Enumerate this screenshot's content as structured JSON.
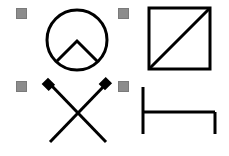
{
  "symbols": [
    {
      "name": "circle-with-chevron",
      "handle": {
        "x": 16,
        "y": 8
      }
    },
    {
      "name": "square-with-diagonal",
      "handle": {
        "x": 118,
        "y": 8
      }
    },
    {
      "name": "crossed-lines",
      "handle": {
        "x": 16,
        "y": 81
      }
    },
    {
      "name": "bracket-bed",
      "handle": {
        "x": 118,
        "y": 81
      }
    }
  ],
  "colors": {
    "stroke": "#000000",
    "handle": "#8c8c8c",
    "background": "#ffffff"
  }
}
